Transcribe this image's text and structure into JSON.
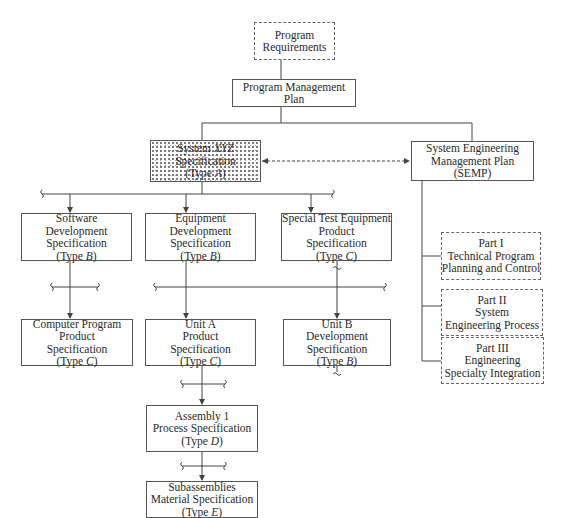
{
  "diagram": {
    "type": "specification-tree",
    "nodes": {
      "program_requirements": {
        "lines": [
          "Program",
          "Requirements"
        ],
        "style": "dashed"
      },
      "program_management_plan": {
        "lines": [
          "Program Management",
          "Plan"
        ],
        "style": "solid"
      },
      "system_spec": {
        "line1": "System ",
        "line1_italic": "XYZ",
        "line2": "Specification",
        "line3_pre": "(Type ",
        "line3_italic": "A",
        "line3_post": ")",
        "style": "stippled"
      },
      "semp": {
        "lines": [
          "System Engineering",
          "Management Plan",
          "(SEMP)"
        ],
        "style": "solid"
      },
      "software_dev_spec": {
        "lines": [
          "Software",
          "Development",
          "Specification"
        ],
        "type_pre": "(Type ",
        "type_letter": "B",
        "type_post": ")"
      },
      "equipment_dev_spec": {
        "lines": [
          "Equipment",
          "Development",
          "Specification"
        ],
        "type_pre": "(Type ",
        "type_letter": "B",
        "type_post": ")"
      },
      "special_test_equipment_spec": {
        "lines": [
          "Special Test Equipment",
          "Product",
          "Specification"
        ],
        "type_pre": "(Type ",
        "type_letter": "C",
        "type_post": ")"
      },
      "computer_program_product_spec": {
        "lines": [
          "Computer Program",
          "Product",
          "Specification"
        ],
        "type_pre": "(Type ",
        "type_letter": "C",
        "type_post": ")"
      },
      "unit_a_product_spec": {
        "lines": [
          "Unit A",
          "Product",
          "Specification"
        ],
        "type_pre": "(Type ",
        "type_letter": "C",
        "type_post": ")"
      },
      "unit_b_dev_spec": {
        "lines": [
          "Unit B",
          "Development",
          "Specification"
        ],
        "type_pre": "(Type ",
        "type_letter": "B",
        "type_post": ")"
      },
      "assembly_1_process_spec": {
        "lines": [
          "Assembly 1",
          "Process Specification"
        ],
        "type_pre": "(Type ",
        "type_letter": "D",
        "type_post": ")"
      },
      "subassemblies_material_spec": {
        "lines": [
          "Subassemblies",
          "Material Specification"
        ],
        "type_pre": "(Type ",
        "type_letter": "E",
        "type_post": ")"
      },
      "semp_part_1": {
        "lines": [
          "Part I",
          "Technical Program",
          "Planning and Control"
        ],
        "style": "dashed"
      },
      "semp_part_2": {
        "lines": [
          "Part II",
          "System",
          "Engineering Process"
        ],
        "style": "dashed"
      },
      "semp_part_3": {
        "lines": [
          "Part III",
          "Engineering",
          "Specialty Integration"
        ],
        "style": "dashed"
      }
    },
    "colors": {
      "line": "#444444",
      "border": "#555555",
      "background": "#ffffff",
      "text": "#2a2a2a"
    }
  }
}
